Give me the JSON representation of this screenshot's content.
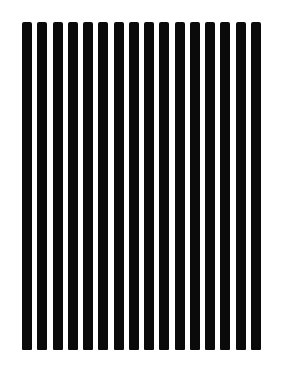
{
  "image": {
    "description": "Vertical black square-wave grating on white background",
    "background_color": "#ffffff",
    "bar_color": "#0a0a0a"
  },
  "grating": {
    "bar_count": 16,
    "first_bar_left": 22,
    "pitch": 15.25,
    "bar_width": 10,
    "top": 22,
    "bottom": 350
  }
}
